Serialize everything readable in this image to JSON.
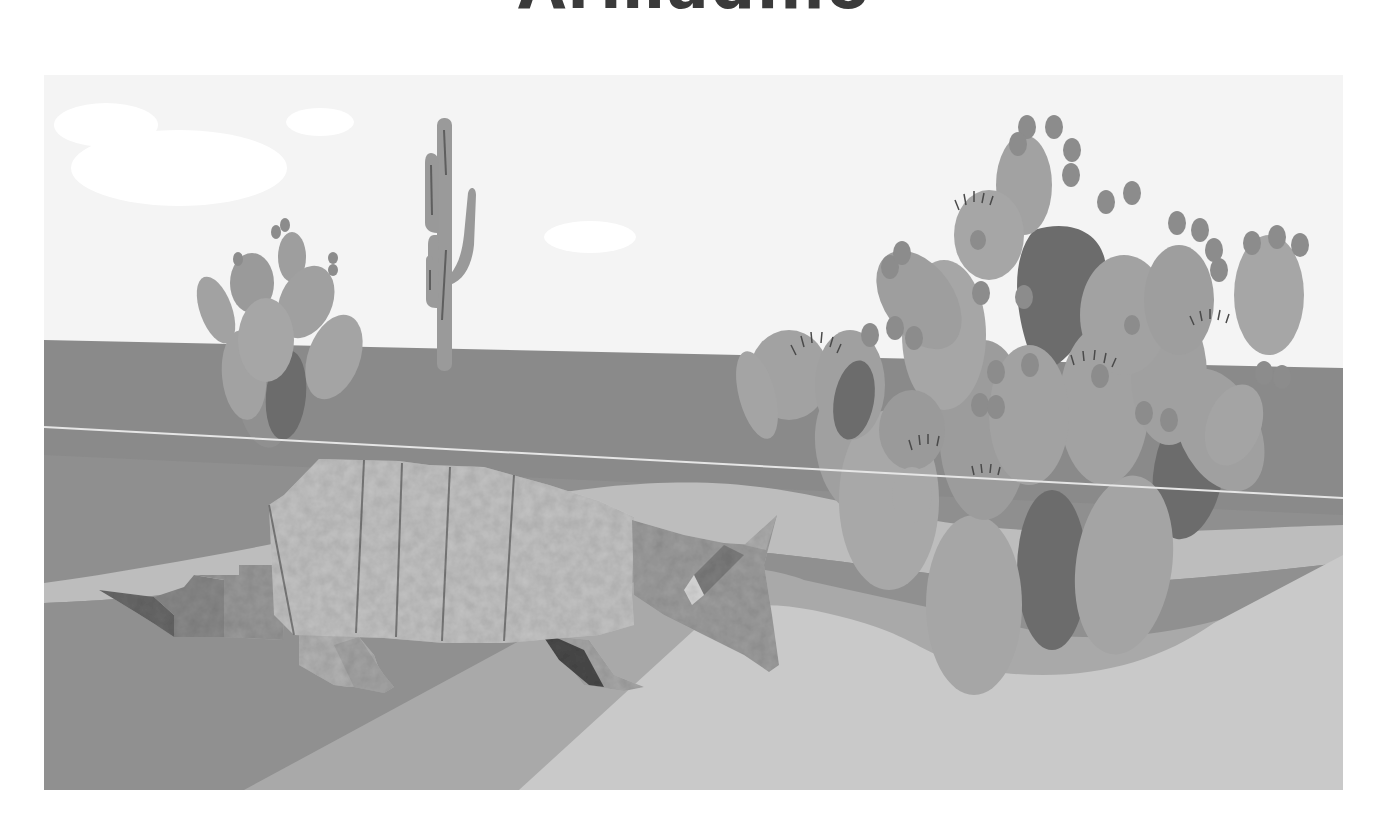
{
  "title": "Armadillo",
  "scene": {
    "subject": "origami armadillo",
    "elements": [
      "sky",
      "clouds",
      "saguaro cactus",
      "small prickly pear cactus",
      "large prickly pear cactus",
      "desert ground bands",
      "wire"
    ],
    "colors": {
      "sky": "#f4f4f4",
      "cloud": "#ffffff",
      "horizon_band": "#8a8a8a",
      "path_light": "#bdbdbd",
      "ground_dark": "#8f8f8f",
      "ground_mid": "#a9a9a9",
      "ground_light": "#c9c9c9",
      "cactus_pad": "#a2a2a2",
      "cactus_pad_alt": "#999999",
      "cactus_dark": "#6c6c6c",
      "cactus_fruit": "#8c8c8c",
      "saguaro": "#9a9a9a",
      "armadillo_shell": "#c4c4c4",
      "armadillo_shade": "#8a8a8a"
    }
  }
}
